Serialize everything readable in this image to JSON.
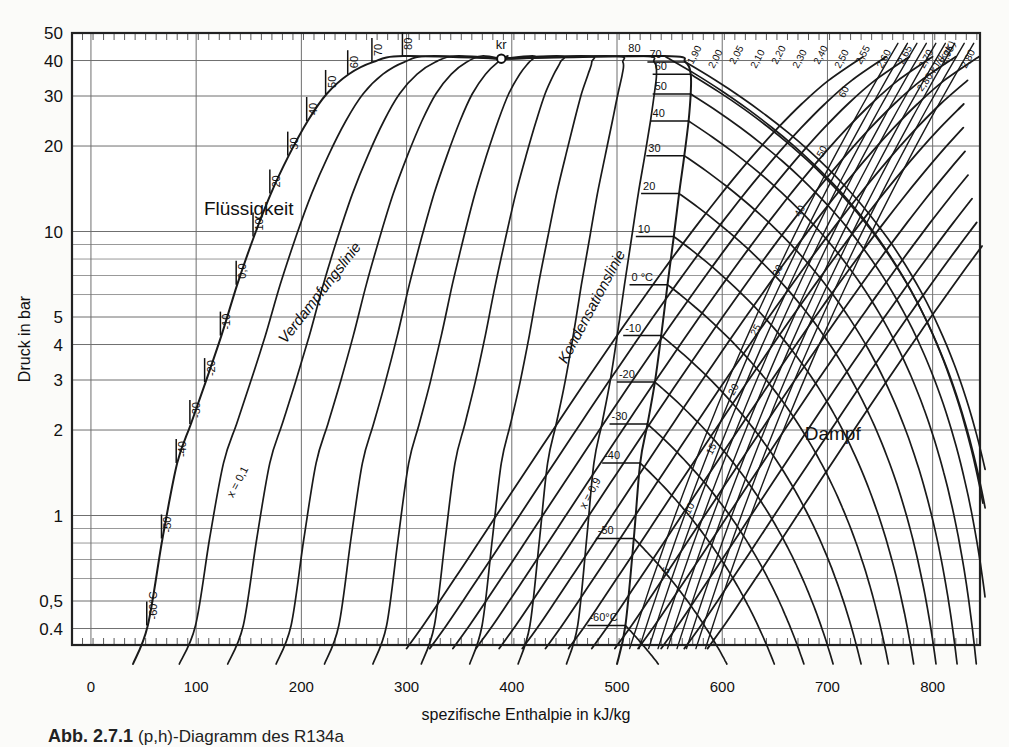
{
  "figure": {
    "caption_label": "Abb. 2.7.1",
    "caption_text": "(p,h)-Diagramm des R134a",
    "title": ""
  },
  "axes": {
    "y": {
      "title": "Druck in bar",
      "ticks": [
        {
          "value": 50,
          "label": "50"
        },
        {
          "value": 40,
          "label": "40"
        },
        {
          "value": 30,
          "label": "30"
        },
        {
          "value": 20,
          "label": "20"
        },
        {
          "value": 10,
          "label": "10"
        },
        {
          "value": 5,
          "label": "5"
        },
        {
          "value": 4,
          "label": "4"
        },
        {
          "value": 3,
          "label": "3"
        },
        {
          "value": 2,
          "label": "2"
        },
        {
          "value": 1,
          "label": "1"
        },
        {
          "value": 0.5,
          "label": "0,5"
        },
        {
          "value": 0.4,
          "label": "0.4"
        }
      ],
      "minor_gridlines": [
        9,
        8,
        7,
        6,
        0.9,
        0.8,
        0.7,
        0.6
      ],
      "range": [
        0.35,
        50
      ],
      "scale": "log"
    },
    "x": {
      "title": "spezifische Enthalpie in kJ/kg",
      "ticks": [
        {
          "value": 0,
          "label": "0"
        },
        {
          "value": 100,
          "label": "100"
        },
        {
          "value": 200,
          "label": "200"
        },
        {
          "value": 300,
          "label": "300"
        },
        {
          "value": 400,
          "label": "400"
        },
        {
          "value": 500,
          "label": "500"
        },
        {
          "value": 600,
          "label": "600"
        },
        {
          "value": 700,
          "label": "700"
        },
        {
          "value": 800,
          "label": "800"
        }
      ],
      "range": [
        -18,
        845
      ],
      "scale": "linear"
    }
  },
  "regions": [
    {
      "name": "liquid",
      "label": "Flüssigkeit",
      "x": 150,
      "y": 11.4
    },
    {
      "name": "vapour",
      "label": "Dampf",
      "x": 705,
      "y": 1.85
    }
  ],
  "curve_labels": [
    {
      "name": "boiling-line",
      "label": "Verdampfungslinie"
    },
    {
      "name": "condensation-line",
      "label": "Kondensationslinie"
    },
    {
      "name": "critical-point",
      "label": "kr"
    },
    {
      "name": "quality-x01",
      "label": "x = 0,1"
    },
    {
      "name": "quality-x09",
      "label": "x = 0,9"
    },
    {
      "name": "entropy-unit",
      "label": "2,80 kJ/(kgK)"
    }
  ],
  "chart_data": {
    "type": "line",
    "title": "(p,h)-Diagramm des R134a",
    "xlabel": "spezifische Enthalpie in kJ/kg",
    "ylabel": "Druck in bar",
    "xlim": [
      -18,
      845
    ],
    "ylim": [
      0.35,
      50
    ],
    "yscale": "log",
    "grid": true,
    "legend": "none",
    "critical_point": {
      "h": 390,
      "p": 40.6,
      "label": "kr"
    },
    "saturation_liquid": [
      {
        "T": -60,
        "h": 54,
        "p": 0.41
      },
      {
        "T": -50,
        "h": 68,
        "p": 0.83
      },
      {
        "T": -40,
        "h": 82,
        "p": 1.53
      },
      {
        "T": -30,
        "h": 95,
        "p": 2.1
      },
      {
        "T": -20,
        "h": 109,
        "p": 2.95
      },
      {
        "T": -10,
        "h": 124,
        "p": 4.3
      },
      {
        "T": 0,
        "h": 139,
        "p": 6.5
      },
      {
        "T": 10,
        "h": 155,
        "p": 9.6
      },
      {
        "T": 20,
        "h": 171,
        "p": 13.6
      },
      {
        "T": 30,
        "h": 188,
        "p": 18.5
      },
      {
        "T": 40,
        "h": 206,
        "p": 24.5
      },
      {
        "T": 50,
        "h": 224,
        "p": 30.5
      },
      {
        "T": 60,
        "h": 245,
        "p": 35.8
      },
      {
        "T": 70,
        "h": 268,
        "p": 39.5
      },
      {
        "T": 80,
        "h": 297,
        "p": 41.5
      }
    ],
    "saturation_vapour": [
      {
        "T": -60,
        "h": 508,
        "p": 0.41
      },
      {
        "T": -50,
        "h": 516,
        "p": 0.83
      },
      {
        "T": -40,
        "h": 522,
        "p": 1.53
      },
      {
        "T": -30,
        "h": 529,
        "p": 2.1
      },
      {
        "T": -20,
        "h": 536,
        "p": 2.95
      },
      {
        "T": -10,
        "h": 542,
        "p": 4.3
      },
      {
        "T": 0,
        "h": 548,
        "p": 6.5
      },
      {
        "T": 10,
        "h": 554,
        "p": 9.6
      },
      {
        "T": 20,
        "h": 559,
        "p": 13.6
      },
      {
        "T": 30,
        "h": 564,
        "p": 18.5
      },
      {
        "T": 40,
        "h": 568,
        "p": 24.5
      },
      {
        "T": 50,
        "h": 570,
        "p": 30.5
      },
      {
        "T": 60,
        "h": 570,
        "p": 35.8
      },
      {
        "T": 70,
        "h": 565,
        "p": 39.5
      },
      {
        "T": 80,
        "h": 545,
        "p": 41.5
      }
    ],
    "isotherm_labels_liquid": [
      "-60°C",
      "-50",
      "-40",
      "-30",
      "-20",
      "-10",
      "0,0",
      "10",
      "20",
      "30",
      "40",
      "50",
      "60",
      "70",
      "80"
    ],
    "isotherm_labels_vapour": [
      "-60°C",
      "-50",
      "-40",
      "-30",
      "-20",
      "-10",
      "0 °C",
      "10",
      "20",
      "30",
      "40",
      "50",
      "60",
      "70",
      "80"
    ],
    "isotherms_superheat": [
      -60,
      -50,
      -40,
      -30,
      -20,
      -10,
      0,
      10,
      20,
      30,
      40,
      50,
      60,
      70,
      80
    ],
    "quality_lines": {
      "labels": [
        "x = 0,1",
        "x = 0,9"
      ],
      "values": [
        0.1,
        0.2,
        0.3,
        0.4,
        0.5,
        0.6,
        0.7,
        0.8,
        0.9
      ]
    },
    "entropy_lines": {
      "unit_label": "2,80 kJ/(kgK)",
      "values": [
        "1,90",
        "2,00",
        "2,05",
        "2,10",
        "2,20",
        "2,30",
        "2,40",
        "2,50",
        "2,55",
        "2,60",
        "2,65",
        "2,70",
        "2,75",
        "2,80"
      ]
    },
    "density_line_labels": [
      "5",
      "10",
      "15",
      "20",
      "25",
      "30",
      "40",
      "50",
      "60",
      "70",
      "80"
    ]
  }
}
